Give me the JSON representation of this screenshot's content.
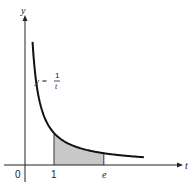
{
  "chart_data": {
    "type": "line",
    "title": "",
    "function": "y = 1/t",
    "curve_label": {
      "lhs": "y =",
      "num": "1",
      "den": "t"
    },
    "xlabel": "t",
    "ylabel": "y",
    "x_ticks": [
      {
        "value": 0,
        "label": "0"
      },
      {
        "value": 1,
        "label": "1"
      },
      {
        "value": 2.718,
        "label": "e"
      }
    ],
    "xlim": [
      -0.7,
      5.5
    ],
    "ylim": [
      -0.5,
      5.0
    ],
    "shaded_region": {
      "from": 1,
      "to": 2.718,
      "under": "y = 1/t",
      "color": "#c8c8c8"
    },
    "series": [
      {
        "name": "y = 1/t",
        "x_range": [
          0.26,
          4.1
        ],
        "points": [
          [
            0.26,
            3.85
          ],
          [
            0.35,
            2.86
          ],
          [
            0.5,
            2.0
          ],
          [
            0.75,
            1.33
          ],
          [
            1,
            1.0
          ],
          [
            1.5,
            0.667
          ],
          [
            2,
            0.5
          ],
          [
            2.718,
            0.368
          ],
          [
            3.5,
            0.286
          ],
          [
            4.1,
            0.244
          ]
        ]
      }
    ],
    "grid": false,
    "legend": null
  },
  "labels": {
    "y_axis": "y",
    "t_axis": "t",
    "origin": "0",
    "one": "1",
    "e": "e",
    "eq_lhs": "y =",
    "eq_num": "1",
    "eq_den": "t"
  },
  "colors": {
    "axis": "#222222",
    "curve": "#111111",
    "shade": "#cccccc"
  }
}
